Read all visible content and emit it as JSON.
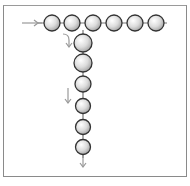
{
  "diagram": {
    "colors": {
      "frame": "#8a8a8a",
      "sphere_outline": "#333333",
      "sphere_fill_light": "#ffffff",
      "sphere_fill_dark": "#a8a8a8",
      "connector": "#777777",
      "arrow": "#999999"
    },
    "horizontal_row": {
      "y": 23,
      "radius": 8,
      "centers_x": [
        52,
        72,
        93,
        114,
        135,
        156
      ]
    },
    "vertical_column": {
      "x": 83,
      "radius": 8,
      "centers_y": [
        43,
        63,
        84,
        106,
        127,
        147
      ]
    },
    "arrows": [
      {
        "name": "entry-arrow",
        "direction": "right"
      },
      {
        "name": "branch-curved-arrow",
        "direction": "down"
      },
      {
        "name": "mid-down-arrow",
        "direction": "down"
      },
      {
        "name": "exit-down-arrow",
        "direction": "down"
      }
    ]
  }
}
